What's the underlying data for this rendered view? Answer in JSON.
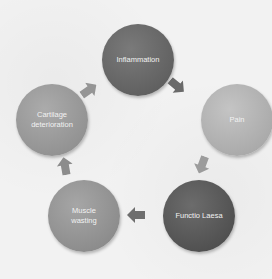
{
  "diagram": {
    "type": "cycle",
    "nodes": [
      {
        "id": "inflammation",
        "label": "Inflammation",
        "color": "#6e6e6e",
        "shade": "#5a5a5a"
      },
      {
        "id": "pain",
        "label": "Pain",
        "color": "#b8b8b8",
        "shade": "#a2a2a2"
      },
      {
        "id": "functio-laesa",
        "label": "Functio Laesa",
        "color": "#606060",
        "shade": "#4c4c4c"
      },
      {
        "id": "muscle-wasting",
        "label": "Muscle wasting",
        "label_lines": [
          "Muscle",
          "wasting"
        ],
        "color": "#9a9a9a",
        "shade": "#858585"
      },
      {
        "id": "cartilage-deterioration",
        "label": "Cartilage deterioration",
        "label_lines": [
          "Cartilage",
          "deterioration"
        ],
        "color": "#a2a2a2",
        "shade": "#8d8d8d"
      }
    ],
    "edges": [
      {
        "from": "inflammation",
        "to": "pain"
      },
      {
        "from": "pain",
        "to": "functio-laesa"
      },
      {
        "from": "functio-laesa",
        "to": "muscle-wasting"
      },
      {
        "from": "muscle-wasting",
        "to": "cartilage-deterioration"
      },
      {
        "from": "cartilage-deterioration",
        "to": "inflammation"
      }
    ],
    "arrow_color": "#7a7a7a"
  }
}
